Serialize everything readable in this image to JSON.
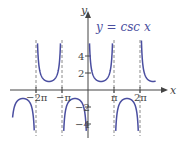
{
  "chart_data": {
    "type": "line",
    "title": "y = csc x",
    "function": "csc x",
    "xlabel": "x",
    "ylabel": "y",
    "x_ticks": [
      "-2π",
      "-π",
      "π",
      "2π"
    ],
    "x_tick_values": [
      -6.2832,
      -3.1416,
      3.1416,
      6.2832
    ],
    "y_ticks": [
      "-4",
      "-2",
      "2",
      "4"
    ],
    "y_tick_values": [
      -4,
      -2,
      2,
      4
    ],
    "xlim": [
      -9.4,
      9.4
    ],
    "ylim": [
      -5.3,
      6.0
    ],
    "asymptotes": [
      -6.2832,
      -3.1416,
      0,
      3.1416,
      6.2832
    ],
    "grid": false,
    "series": [
      {
        "name": "y = csc x",
        "color": "#4a4ea0"
      }
    ],
    "asymptote_style": "dashed",
    "colors": {
      "curve": "#4a4ea0",
      "axis": "#444444",
      "asymptote": "#888888"
    }
  },
  "labels": {
    "title": "y = csc x",
    "x_axis": "x",
    "y_axis": "y",
    "x_ticks": [
      "−2π",
      "−π",
      "π",
      "2π"
    ],
    "y_ticks": [
      "4",
      "2",
      "−2",
      "−4"
    ]
  }
}
